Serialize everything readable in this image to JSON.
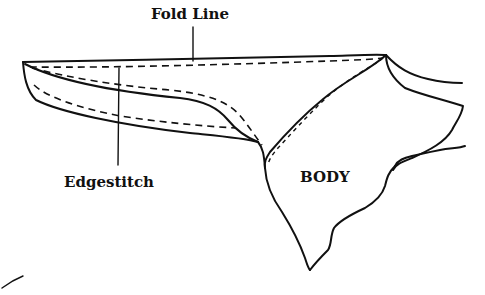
{
  "diagram": {
    "labels": {
      "fold_line": "Fold Line",
      "edgestitch": "Edgestitch",
      "body": "BODY"
    },
    "colors": {
      "ink": "#111111",
      "background": "#ffffff"
    }
  }
}
